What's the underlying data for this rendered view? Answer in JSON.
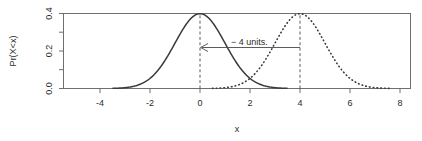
{
  "chart_data": {
    "type": "line",
    "title": "",
    "xlabel": "x",
    "ylabel": "Pr(X<x)",
    "xlim": [
      -5.5,
      8.8
    ],
    "ylim": [
      -0.02,
      0.43
    ],
    "grid": false,
    "legend": "none",
    "xticks": [
      "-4",
      "-2",
      "0",
      "2",
      "4",
      "6",
      "8"
    ],
    "xtick_values": [
      -4,
      -2,
      0,
      2,
      4,
      6,
      8
    ],
    "yticks": [
      "0.0",
      "0.2",
      "0.4"
    ],
    "ytick_values": [
      0.0,
      0.2,
      0.4
    ],
    "yminor_ticks": [
      0.1,
      0.3
    ],
    "series": [
      {
        "name": "solid-normal-curve",
        "style": "solid",
        "mean": 0,
        "sd": 1,
        "peak_x": 0,
        "peak_y": 0.4,
        "x_start": -3.5,
        "x_end": 3.5
      },
      {
        "name": "dotted-normal-curve",
        "style": "dotted",
        "mean": 4,
        "sd": 1,
        "peak_x": 4,
        "peak_y": 0.4,
        "x_start": 0.5,
        "x_end": 7.6
      }
    ],
    "reference_lines": [
      {
        "name": "vline-at-0",
        "x": 0,
        "y_from": 0.0,
        "y_to": 0.4,
        "style": "dashed"
      },
      {
        "name": "vline-at-4",
        "x": 4,
        "y_from": 0.0,
        "y_to": 0.4,
        "style": "dashed"
      }
    ],
    "annotations": [
      {
        "name": "shift-annotation",
        "text": "− 4 units.",
        "arrow_from_x": 4,
        "arrow_to_x": 0,
        "arrow_y": 0.205,
        "direction": "left"
      }
    ]
  }
}
